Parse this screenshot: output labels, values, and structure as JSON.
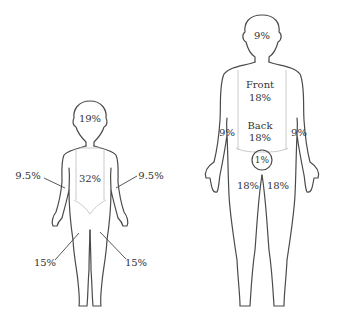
{
  "child": {
    "head": "19%",
    "trunk": "32%",
    "arm_left": "9.5%",
    "arm_right": "9.5%",
    "leg_left": "15%",
    "leg_right": "15%"
  },
  "adult": {
    "head": "9%",
    "front_label": "Front",
    "front_value": "18%",
    "back_label": "Back",
    "back_value": "18%",
    "arm_left": "9%",
    "arm_right": "9%",
    "genitals": "1%",
    "leg_left": "18%",
    "leg_right": "18%"
  }
}
